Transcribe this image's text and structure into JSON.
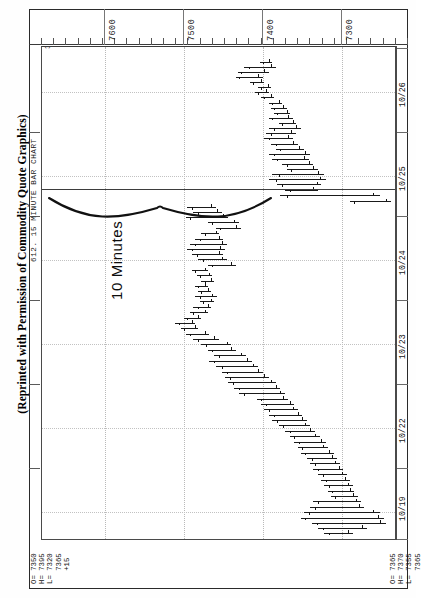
{
  "caption": "(Reprinted with Permission of Commodity Quote Graphics)",
  "chart_title": "612. 15 MINUTE BAR CHART",
  "top_left_marker": "38",
  "quote_left": {
    "open_label": "O= 7350",
    "high_label": "H= 7395",
    "low_label": "L= 7320",
    "last_label": "   7365",
    "change_label": "   +15"
  },
  "quote_right": {
    "open_label": "O= 7365",
    "high_label": "H= 7370",
    "low_label": "L= 7355",
    "last_label": "   7365"
  },
  "annotation": {
    "brace_label": "10 Minutes",
    "icon": "curly-brace-horizontal"
  },
  "price_axis": {
    "labels": [
      "7600",
      "7500",
      "7400",
      "7300"
    ],
    "min": 7230,
    "max": 7680
  },
  "date_axis": {
    "labels": [
      "10/26",
      "10/25",
      "10/24",
      "10/23",
      "10/22",
      "10/19"
    ]
  },
  "chart_data": {
    "type": "bar",
    "title": "612. 15 MINUTE BAR CHART",
    "subtitle": "Silver / 15 minute OHLC bars",
    "orientation": "rotated-90",
    "xlabel": "Date / Time",
    "ylabel": "Price",
    "ylim": [
      7230,
      7680
    ],
    "grid": true,
    "legend": null,
    "price_ticks": [
      7600,
      7500,
      7400,
      7300
    ],
    "date_ticks": [
      "10/19",
      "10/22",
      "10/23",
      "10/24",
      "10/25",
      "10/26"
    ],
    "note": "Each item is one 15-minute OHLC bar. pos = vertical position 0..1 down the rotated plot; low/high/open/close are prices.",
    "bars": [
      {
        "pos": 0.03,
        "low": 7388,
        "high": 7404,
        "open": 7392,
        "close": 7400
      },
      {
        "pos": 0.04,
        "low": 7384,
        "high": 7424,
        "open": 7390,
        "close": 7418
      },
      {
        "pos": 0.05,
        "low": 7392,
        "high": 7432,
        "open": 7398,
        "close": 7428
      },
      {
        "pos": 0.06,
        "low": 7400,
        "high": 7434,
        "open": 7406,
        "close": 7430
      },
      {
        "pos": 0.071,
        "low": 7398,
        "high": 7416,
        "open": 7402,
        "close": 7412
      },
      {
        "pos": 0.081,
        "low": 7390,
        "high": 7406,
        "open": 7394,
        "close": 7402
      },
      {
        "pos": 0.091,
        "low": 7392,
        "high": 7410,
        "open": 7396,
        "close": 7406
      },
      {
        "pos": 0.101,
        "low": 7386,
        "high": 7402,
        "open": 7390,
        "close": 7398
      },
      {
        "pos": 0.113,
        "low": 7376,
        "high": 7392,
        "open": 7380,
        "close": 7388
      },
      {
        "pos": 0.123,
        "low": 7370,
        "high": 7390,
        "open": 7374,
        "close": 7386
      },
      {
        "pos": 0.133,
        "low": 7366,
        "high": 7386,
        "open": 7370,
        "close": 7382
      },
      {
        "pos": 0.143,
        "low": 7362,
        "high": 7392,
        "open": 7368,
        "close": 7388
      },
      {
        "pos": 0.154,
        "low": 7358,
        "high": 7380,
        "open": 7362,
        "close": 7376
      },
      {
        "pos": 0.164,
        "low": 7352,
        "high": 7392,
        "open": 7358,
        "close": 7386
      },
      {
        "pos": 0.174,
        "low": 7358,
        "high": 7396,
        "open": 7364,
        "close": 7390
      },
      {
        "pos": 0.184,
        "low": 7362,
        "high": 7398,
        "open": 7368,
        "close": 7392
      },
      {
        "pos": 0.196,
        "low": 7356,
        "high": 7390,
        "open": 7362,
        "close": 7384
      },
      {
        "pos": 0.206,
        "low": 7348,
        "high": 7384,
        "open": 7354,
        "close": 7378
      },
      {
        "pos": 0.216,
        "low": 7340,
        "high": 7392,
        "open": 7346,
        "close": 7386
      },
      {
        "pos": 0.226,
        "low": 7342,
        "high": 7388,
        "open": 7348,
        "close": 7382
      },
      {
        "pos": 0.237,
        "low": 7336,
        "high": 7376,
        "open": 7342,
        "close": 7370
      },
      {
        "pos": 0.247,
        "low": 7330,
        "high": 7370,
        "open": 7336,
        "close": 7364
      },
      {
        "pos": 0.257,
        "low": 7322,
        "high": 7388,
        "open": 7330,
        "close": 7380
      },
      {
        "pos": 0.268,
        "low": 7320,
        "high": 7392,
        "open": 7328,
        "close": 7384
      },
      {
        "pos": 0.278,
        "low": 7326,
        "high": 7382,
        "open": 7332,
        "close": 7376
      },
      {
        "pos": 0.289,
        "low": 7330,
        "high": 7372,
        "open": 7336,
        "close": 7366
      },
      {
        "pos": 0.3,
        "low": 7252,
        "high": 7378,
        "open": 7260,
        "close": 7370
      },
      {
        "pos": 0.312,
        "low": 7238,
        "high": 7290,
        "open": 7244,
        "close": 7284
      },
      {
        "pos": 0.324,
        "low": 7460,
        "high": 7496,
        "open": 7466,
        "close": 7490
      },
      {
        "pos": 0.334,
        "low": 7452,
        "high": 7488,
        "open": 7458,
        "close": 7482
      },
      {
        "pos": 0.344,
        "low": 7444,
        "high": 7498,
        "open": 7450,
        "close": 7492
      },
      {
        "pos": 0.355,
        "low": 7430,
        "high": 7470,
        "open": 7436,
        "close": 7464
      },
      {
        "pos": 0.366,
        "low": 7428,
        "high": 7460,
        "open": 7434,
        "close": 7454
      },
      {
        "pos": 0.377,
        "low": 7456,
        "high": 7478,
        "open": 7460,
        "close": 7474
      },
      {
        "pos": 0.388,
        "low": 7450,
        "high": 7486,
        "open": 7456,
        "close": 7480
      },
      {
        "pos": 0.398,
        "low": 7446,
        "high": 7492,
        "open": 7452,
        "close": 7486
      },
      {
        "pos": 0.408,
        "low": 7448,
        "high": 7496,
        "open": 7454,
        "close": 7490
      },
      {
        "pos": 0.419,
        "low": 7450,
        "high": 7490,
        "open": 7456,
        "close": 7484
      },
      {
        "pos": 0.43,
        "low": 7446,
        "high": 7482,
        "open": 7452,
        "close": 7476
      },
      {
        "pos": 0.441,
        "low": 7434,
        "high": 7470,
        "open": 7440,
        "close": 7464
      },
      {
        "pos": 0.452,
        "low": 7470,
        "high": 7490,
        "open": 7474,
        "close": 7486
      },
      {
        "pos": 0.462,
        "low": 7464,
        "high": 7484,
        "open": 7468,
        "close": 7480
      },
      {
        "pos": 0.473,
        "low": 7462,
        "high": 7478,
        "open": 7466,
        "close": 7474
      },
      {
        "pos": 0.483,
        "low": 7470,
        "high": 7486,
        "open": 7474,
        "close": 7482
      },
      {
        "pos": 0.494,
        "low": 7466,
        "high": 7482,
        "open": 7470,
        "close": 7478
      },
      {
        "pos": 0.505,
        "low": 7458,
        "high": 7486,
        "open": 7464,
        "close": 7480
      },
      {
        "pos": 0.515,
        "low": 7462,
        "high": 7480,
        "open": 7466,
        "close": 7476
      },
      {
        "pos": 0.526,
        "low": 7466,
        "high": 7488,
        "open": 7470,
        "close": 7482
      },
      {
        "pos": 0.537,
        "low": 7470,
        "high": 7492,
        "open": 7474,
        "close": 7488
      },
      {
        "pos": 0.548,
        "low": 7478,
        "high": 7500,
        "open": 7482,
        "close": 7496
      },
      {
        "pos": 0.558,
        "low": 7486,
        "high": 7512,
        "open": 7490,
        "close": 7506
      },
      {
        "pos": 0.569,
        "low": 7482,
        "high": 7504,
        "open": 7486,
        "close": 7500
      },
      {
        "pos": 0.58,
        "low": 7468,
        "high": 7498,
        "open": 7474,
        "close": 7492
      },
      {
        "pos": 0.591,
        "low": 7456,
        "high": 7488,
        "open": 7462,
        "close": 7482
      },
      {
        "pos": 0.602,
        "low": 7440,
        "high": 7478,
        "open": 7446,
        "close": 7472
      },
      {
        "pos": 0.613,
        "low": 7434,
        "high": 7470,
        "open": 7440,
        "close": 7464
      },
      {
        "pos": 0.624,
        "low": 7422,
        "high": 7462,
        "open": 7428,
        "close": 7456
      },
      {
        "pos": 0.635,
        "low": 7414,
        "high": 7468,
        "open": 7420,
        "close": 7462
      },
      {
        "pos": 0.646,
        "low": 7406,
        "high": 7460,
        "open": 7412,
        "close": 7452
      },
      {
        "pos": 0.657,
        "low": 7400,
        "high": 7452,
        "open": 7406,
        "close": 7446
      },
      {
        "pos": 0.668,
        "low": 7392,
        "high": 7448,
        "open": 7398,
        "close": 7442
      },
      {
        "pos": 0.679,
        "low": 7384,
        "high": 7444,
        "open": 7390,
        "close": 7438
      },
      {
        "pos": 0.69,
        "low": 7378,
        "high": 7436,
        "open": 7384,
        "close": 7430
      },
      {
        "pos": 0.701,
        "low": 7372,
        "high": 7430,
        "open": 7378,
        "close": 7424
      },
      {
        "pos": 0.712,
        "low": 7368,
        "high": 7408,
        "open": 7374,
        "close": 7402
      },
      {
        "pos": 0.722,
        "low": 7360,
        "high": 7402,
        "open": 7366,
        "close": 7396
      },
      {
        "pos": 0.733,
        "low": 7356,
        "high": 7398,
        "open": 7362,
        "close": 7392
      },
      {
        "pos": 0.744,
        "low": 7350,
        "high": 7392,
        "open": 7356,
        "close": 7386
      },
      {
        "pos": 0.755,
        "low": 7344,
        "high": 7388,
        "open": 7350,
        "close": 7382
      },
      {
        "pos": 0.766,
        "low": 7340,
        "high": 7380,
        "open": 7346,
        "close": 7374
      },
      {
        "pos": 0.777,
        "low": 7334,
        "high": 7372,
        "open": 7340,
        "close": 7366
      },
      {
        "pos": 0.788,
        "low": 7328,
        "high": 7366,
        "open": 7334,
        "close": 7360
      },
      {
        "pos": 0.799,
        "low": 7320,
        "high": 7360,
        "open": 7326,
        "close": 7354
      },
      {
        "pos": 0.81,
        "low": 7318,
        "high": 7356,
        "open": 7324,
        "close": 7350
      },
      {
        "pos": 0.821,
        "low": 7310,
        "high": 7352,
        "open": 7316,
        "close": 7346
      },
      {
        "pos": 0.832,
        "low": 7306,
        "high": 7344,
        "open": 7312,
        "close": 7338
      },
      {
        "pos": 0.843,
        "low": 7302,
        "high": 7340,
        "open": 7308,
        "close": 7334
      },
      {
        "pos": 0.854,
        "low": 7298,
        "high": 7336,
        "open": 7304,
        "close": 7330
      },
      {
        "pos": 0.865,
        "low": 7294,
        "high": 7330,
        "open": 7300,
        "close": 7324
      },
      {
        "pos": 0.876,
        "low": 7290,
        "high": 7326,
        "open": 7296,
        "close": 7320
      },
      {
        "pos": 0.887,
        "low": 7286,
        "high": 7322,
        "open": 7292,
        "close": 7316
      },
      {
        "pos": 0.898,
        "low": 7284,
        "high": 7318,
        "open": 7290,
        "close": 7312
      },
      {
        "pos": 0.909,
        "low": 7280,
        "high": 7314,
        "open": 7286,
        "close": 7308
      },
      {
        "pos": 0.92,
        "low": 7276,
        "high": 7336,
        "open": 7282,
        "close": 7330
      },
      {
        "pos": 0.931,
        "low": 7272,
        "high": 7340,
        "open": 7278,
        "close": 7334
      },
      {
        "pos": 0.942,
        "low": 7252,
        "high": 7348,
        "open": 7260,
        "close": 7342
      },
      {
        "pos": 0.953,
        "low": 7246,
        "high": 7352,
        "open": 7254,
        "close": 7346
      },
      {
        "pos": 0.963,
        "low": 7244,
        "high": 7338,
        "open": 7252,
        "close": 7332
      },
      {
        "pos": 0.973,
        "low": 7268,
        "high": 7330,
        "open": 7274,
        "close": 7324
      },
      {
        "pos": 0.983,
        "low": 7286,
        "high": 7322,
        "open": 7292,
        "close": 7316
      }
    ]
  }
}
